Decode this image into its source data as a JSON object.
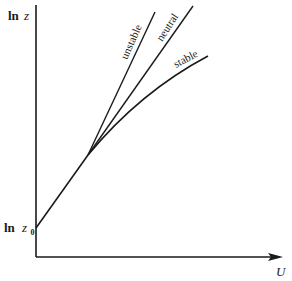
{
  "diagram": {
    "y_axis_label_prefix": "ln",
    "y_axis_label_var": "z",
    "y0_label_prefix": "ln",
    "y0_label_var": "z",
    "y0_label_sub": "0",
    "x_axis_label": "U",
    "curves": [
      {
        "name": "unstable",
        "label": "unstable"
      },
      {
        "name": "neutral",
        "label": "neutral"
      },
      {
        "name": "stable",
        "label": "stable"
      }
    ],
    "colors": {
      "ink": "#1a1a1a",
      "background": "#ffffff"
    }
  }
}
